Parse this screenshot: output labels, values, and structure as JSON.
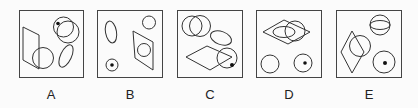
{
  "diagram": {
    "type": "visual-reasoning-option-set",
    "stroke_color": "#333333",
    "frame_color": "#444444",
    "options": [
      {
        "label": "A",
        "shapes": [
          "parallelogram",
          "circle-overlapping-parallelogram",
          "two-overlapping-circles-with-dot",
          "tilted-ellipse"
        ]
      },
      {
        "label": "B",
        "shapes": [
          "tilted-ellipse",
          "small-circle",
          "parallelogram-containing-circle",
          "circle-with-dot"
        ]
      },
      {
        "label": "C",
        "shapes": [
          "two-overlapping-circles",
          "tilted-ellipse",
          "rhombus",
          "circle-with-dot-overlapping-rhombus"
        ]
      },
      {
        "label": "D",
        "shapes": [
          "rhombus-containing-ellipse",
          "circle-overlapping-rhombus",
          "circle",
          "circle-with-dot"
        ]
      },
      {
        "label": "E",
        "shapes": [
          "circle-with-inner-ellipse",
          "rhombus",
          "circle-overlapping-rhombus",
          "circle-with-dot"
        ]
      }
    ]
  }
}
